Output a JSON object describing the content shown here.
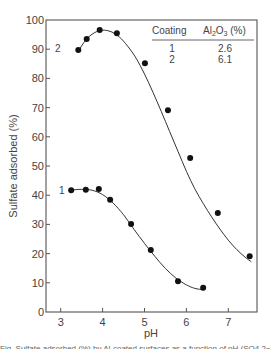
{
  "chart_data": {
    "type": "line",
    "title": "",
    "xlabel": "pH",
    "ylabel": "Sulfate adsorbed (%)",
    "xlim": [
      2.65,
      7.67
    ],
    "ylim": [
      0,
      100
    ],
    "xticks": [
      3,
      4,
      5,
      6,
      7
    ],
    "yticks": [
      0,
      10,
      20,
      30,
      40,
      50,
      60,
      70,
      80,
      90,
      100
    ],
    "grid": false,
    "series": [
      {
        "name": "1",
        "label": "1",
        "markers": "filled-circle",
        "x": [
          3.25,
          3.6,
          3.91,
          4.18,
          4.68,
          5.15,
          5.8,
          6.4
        ],
        "y": [
          41.7,
          41.9,
          42.1,
          38.4,
          30.1,
          21.2,
          10.5,
          8.3
        ],
        "curve_x": [
          3.25,
          3.5,
          3.75,
          4.0,
          4.25,
          4.5,
          4.75,
          5.0,
          5.25,
          5.5,
          5.75,
          6.0,
          6.2,
          6.4
        ],
        "curve_y": [
          41.8,
          42.0,
          41.7,
          40.2,
          37.3,
          33.3,
          28.3,
          23.5,
          19.0,
          14.9,
          11.6,
          9.3,
          8.1,
          7.6
        ]
      },
      {
        "name": "2",
        "label": "2",
        "markers": "filled-circle",
        "x": [
          3.42,
          3.62,
          3.93,
          4.34,
          5.01,
          5.56,
          6.09,
          6.75,
          7.51
        ],
        "y": [
          89.7,
          93.5,
          96.6,
          95.5,
          85.2,
          69.1,
          52.7,
          33.9,
          19.1
        ],
        "curve_x": [
          3.42,
          3.6,
          3.8,
          4.0,
          4.2,
          4.4,
          4.6,
          4.8,
          5.0,
          5.2,
          5.4,
          5.6,
          5.8,
          6.0,
          6.2,
          6.4,
          6.6,
          6.8,
          7.0,
          7.2,
          7.4,
          7.55
        ],
        "curve_y": [
          89.3,
          93.2,
          95.6,
          96.5,
          96.0,
          94.2,
          91.0,
          86.9,
          81.5,
          75.3,
          68.7,
          61.8,
          55.0,
          48.2,
          42.2,
          37.2,
          32.6,
          28.4,
          24.6,
          21.4,
          18.8,
          17.2
        ]
      }
    ],
    "legend": {
      "position": "upper-right",
      "type": "table",
      "headers": [
        "Coating",
        "Al2O3 (%)"
      ],
      "rows": [
        [
          "1",
          "2.6"
        ],
        [
          "2",
          "6.1"
        ]
      ]
    }
  },
  "axes": {
    "x_title": "pH",
    "y_title": "Sulfate adsorbed (%)",
    "x_tick_labels": [
      "3",
      "4",
      "5",
      "6",
      "7"
    ],
    "y_tick_labels": [
      "0",
      "10",
      "20",
      "30",
      "40",
      "50",
      "60",
      "70",
      "80",
      "90",
      "100"
    ]
  },
  "legend_table": {
    "header_coating": "Coating",
    "header_al": "Al",
    "header_sub2": "2",
    "header_o": "O",
    "header_sub3": "3",
    "header_pct": " (%)",
    "row1_coating": "1",
    "row1_value": "2.6",
    "row2_coating": "2",
    "row2_value": "6.1"
  },
  "curve_labels": {
    "curve1": "1",
    "curve2": "2"
  },
  "caption": "Fig. Sulfate adsorbed (%) by Al-coated surfaces as a function of pH (SO4 2− adsorption)"
}
